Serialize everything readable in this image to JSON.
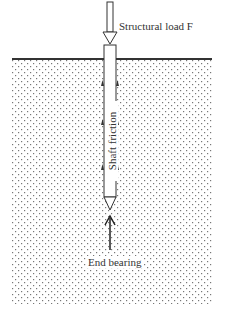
{
  "diagram": {
    "labels": {
      "structural_load": "Structural load F",
      "shaft_friction": "Shaft friction",
      "end_bearing": "End bearing"
    },
    "colors": {
      "line": "#333333",
      "soil_dot": "#777777",
      "background": "#ffffff"
    }
  }
}
